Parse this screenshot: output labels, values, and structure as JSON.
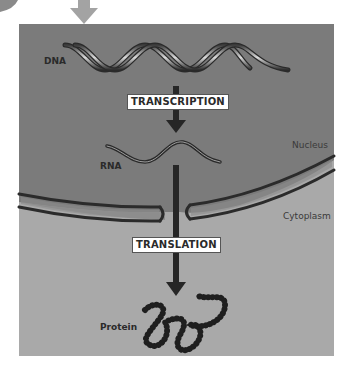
{
  "diagram": {
    "colors": {
      "nucleus_bg": "#7a7a7a",
      "cytoplasm_bg": "#a9a9a9",
      "membrane": "#2b2b2b",
      "arrow": "#2a2a2a",
      "top_arrow": "#a0a0a0",
      "label_box_bg": "#ffffff"
    },
    "molecules": {
      "dna": "DNA",
      "rna": "RNA",
      "protein": "Protein"
    },
    "processes": {
      "transcription": "TRANSCRIPTION",
      "translation": "TRANSLATION"
    },
    "regions": {
      "nucleus": "Nucleus",
      "cytoplasm": "Cytoplasm"
    }
  }
}
